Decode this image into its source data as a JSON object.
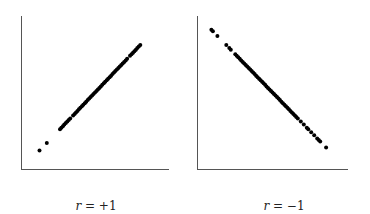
{
  "chart_data": [
    {
      "type": "scatter",
      "title": "",
      "caption": "r = +1",
      "caption_parts": {
        "var": "r",
        "rest": " = +1"
      },
      "xlabel": "",
      "ylabel": "",
      "xlim": [
        0,
        1
      ],
      "ylim": [
        0,
        1
      ],
      "grid": false,
      "relation": "perfect positive linear",
      "points_x": [
        0.12,
        0.17,
        0.26,
        0.27,
        0.28,
        0.29,
        0.3,
        0.31,
        0.32,
        0.33,
        0.35,
        0.36,
        0.37,
        0.38,
        0.39,
        0.4,
        0.41,
        0.42,
        0.43,
        0.44,
        0.45,
        0.46,
        0.47,
        0.48,
        0.49,
        0.5,
        0.51,
        0.52,
        0.53,
        0.54,
        0.55,
        0.56,
        0.57,
        0.58,
        0.59,
        0.6,
        0.61,
        0.62,
        0.63,
        0.64,
        0.65,
        0.66,
        0.67,
        0.68,
        0.69,
        0.7,
        0.71,
        0.72,
        0.74,
        0.75,
        0.76,
        0.77,
        0.78,
        0.79,
        0.8,
        0.81
      ],
      "points_y": [
        0.12,
        0.17,
        0.26,
        0.27,
        0.28,
        0.29,
        0.3,
        0.31,
        0.32,
        0.33,
        0.35,
        0.36,
        0.37,
        0.38,
        0.39,
        0.4,
        0.41,
        0.42,
        0.43,
        0.44,
        0.45,
        0.46,
        0.47,
        0.48,
        0.49,
        0.5,
        0.51,
        0.52,
        0.53,
        0.54,
        0.55,
        0.56,
        0.57,
        0.58,
        0.59,
        0.6,
        0.61,
        0.62,
        0.63,
        0.64,
        0.65,
        0.66,
        0.67,
        0.68,
        0.69,
        0.7,
        0.71,
        0.72,
        0.74,
        0.75,
        0.76,
        0.77,
        0.78,
        0.79,
        0.8,
        0.81
      ]
    },
    {
      "type": "scatter",
      "title": "",
      "caption": "r = −1",
      "caption_parts": {
        "var": "r",
        "rest": " = −1"
      },
      "xlabel": "",
      "ylabel": "",
      "xlim": [
        0,
        1
      ],
      "ylim": [
        0,
        1
      ],
      "grid": false,
      "relation": "perfect negative linear",
      "points_x": [
        0.09,
        0.1,
        0.13,
        0.19,
        0.21,
        0.22,
        0.25,
        0.26,
        0.27,
        0.28,
        0.29,
        0.3,
        0.31,
        0.32,
        0.33,
        0.34,
        0.35,
        0.36,
        0.37,
        0.38,
        0.39,
        0.4,
        0.41,
        0.42,
        0.43,
        0.44,
        0.45,
        0.46,
        0.47,
        0.48,
        0.49,
        0.5,
        0.51,
        0.52,
        0.53,
        0.54,
        0.55,
        0.56,
        0.57,
        0.58,
        0.59,
        0.6,
        0.61,
        0.62,
        0.63,
        0.64,
        0.65,
        0.66,
        0.67,
        0.69,
        0.71,
        0.73,
        0.74,
        0.76,
        0.78,
        0.8,
        0.81,
        0.82,
        0.86
      ],
      "points_y": [
        0.91,
        0.9,
        0.87,
        0.81,
        0.79,
        0.78,
        0.75,
        0.74,
        0.73,
        0.72,
        0.71,
        0.7,
        0.69,
        0.68,
        0.67,
        0.66,
        0.65,
        0.64,
        0.63,
        0.62,
        0.61,
        0.6,
        0.59,
        0.58,
        0.57,
        0.56,
        0.55,
        0.54,
        0.53,
        0.52,
        0.51,
        0.5,
        0.49,
        0.48,
        0.47,
        0.46,
        0.45,
        0.44,
        0.43,
        0.42,
        0.41,
        0.4,
        0.39,
        0.38,
        0.37,
        0.36,
        0.35,
        0.34,
        0.33,
        0.31,
        0.29,
        0.27,
        0.26,
        0.24,
        0.22,
        0.2,
        0.19,
        0.18,
        0.14
      ]
    }
  ]
}
